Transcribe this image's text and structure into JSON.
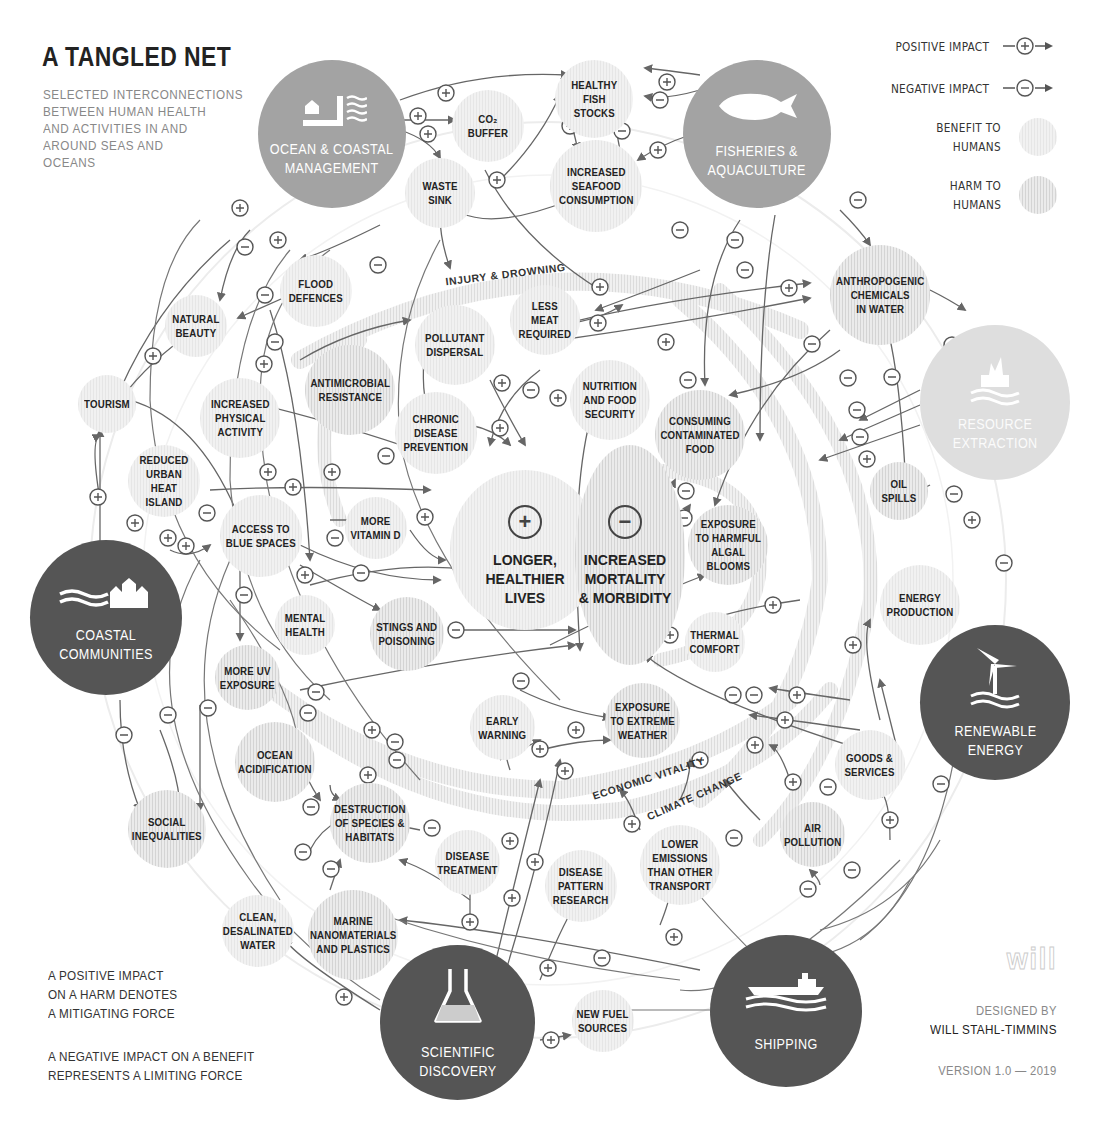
{
  "header": {
    "title": "A TANGLED NET",
    "subtitle": "SELECTED INTERCONNECTIONS\nBETWEEN HUMAN HEALTH\nAND ACTIVITIES IN AND\nAROUND SEAS AND\nOCEANS"
  },
  "legend": {
    "positive_impact": "POSITIVE IMPACT",
    "negative_impact": "NEGATIVE IMPACT",
    "benefit": "BENEFIT TO\nHUMANS",
    "harm": "HARM TO\nHUMANS",
    "positive_icon": "plus-arrow-icon",
    "negative_icon": "minus-arrow-icon"
  },
  "notes": {
    "mitigating": "A POSITIVE IMPACT\nON A HARM DENOTES\nA MITIGATING FORCE",
    "limiting": "A NEGATIVE IMPACT ON A BENEFIT\nREPRESENTS A LIMITING FORCE"
  },
  "credit": {
    "logo": "will",
    "designed_by_label": "DESIGNED BY",
    "designer": "WILL STAHL-TIMMINS",
    "version": "VERSION 1.0 — 2019"
  },
  "colors": {
    "hub_dark": "#555555",
    "hub_mid": "#a3a3a3",
    "hub_light": "#dedede",
    "line": "#666666",
    "benefit_fill": "#efefef",
    "harm_fill": "#e0e0e0"
  },
  "center": {
    "benefit": {
      "sign": "+",
      "label": "LONGER,\nHEALTHIER\nLIVES"
    },
    "harm": {
      "sign": "−",
      "label": "INCREASED\nMORTALITY\n& MORBIDITY"
    }
  },
  "bands": {
    "injury": "INJURY & DROWNING",
    "economic": "ECONOMIC VITALITY",
    "climate": "CLIMATE CHANGE"
  },
  "hubs": [
    {
      "id": "ocean",
      "label": "OCEAN & COASTAL\nMANAGEMENT",
      "icon": "coastal-management-icon"
    },
    {
      "id": "fisheries",
      "label": "FISHERIES &\nAQUACULTURE",
      "icon": "fish-icon"
    },
    {
      "id": "resource",
      "label": "RESOURCE\nEXTRACTION",
      "icon": "oil-rig-icon"
    },
    {
      "id": "renewable",
      "label": "RENEWABLE\nENERGY",
      "icon": "wind-turbine-icon"
    },
    {
      "id": "shipping",
      "label": "SHIPPING",
      "icon": "ship-icon"
    },
    {
      "id": "science",
      "label": "SCIENTIFIC\nDISCOVERY",
      "icon": "flask-icon"
    },
    {
      "id": "coastal",
      "label": "COASTAL\nCOMMUNITIES",
      "icon": "coastal-town-icon"
    }
  ],
  "nodes": [
    {
      "label": "HEALTHY\nFISH\nSTOCKS",
      "type": "benefit"
    },
    {
      "label": "CO₂\nBUFFER",
      "type": "benefit"
    },
    {
      "label": "WASTE\nSINK",
      "type": "benefit"
    },
    {
      "label": "INCREASED\nSEAFOOD\nCONSUMPTION",
      "type": "benefit"
    },
    {
      "label": "FLOOD\nDEFENCES",
      "type": "benefit"
    },
    {
      "label": "NATURAL\nBEAUTY",
      "type": "benefit"
    },
    {
      "label": "LESS\nMEAT\nREQUIRED",
      "type": "benefit"
    },
    {
      "label": "ANTHROPOGENIC\nCHEMICALS\nIN WATER",
      "type": "harm"
    },
    {
      "label": "POLLUTANT\nDISPERSAL",
      "type": "benefit"
    },
    {
      "label": "ANTIMICROBIAL\nRESISTANCE",
      "type": "harm"
    },
    {
      "label": "NUTRITION\nAND FOOD\nSECURITY",
      "type": "benefit"
    },
    {
      "label": "TOURISM",
      "type": "benefit"
    },
    {
      "label": "INCREASED\nPHYSICAL\nACTIVITY",
      "type": "benefit"
    },
    {
      "label": "CHRONIC\nDISEASE\nPREVENTION",
      "type": "benefit"
    },
    {
      "label": "CONSUMING\nCONTAMINATED\nFOOD",
      "type": "harm"
    },
    {
      "label": "REDUCED\nURBAN HEAT\nISLAND",
      "type": "benefit"
    },
    {
      "label": "OIL\nSPILLS",
      "type": "harm"
    },
    {
      "label": "ACCESS TO\nBLUE SPACES",
      "type": "benefit"
    },
    {
      "label": "MORE\nVITAMIN D",
      "type": "benefit"
    },
    {
      "label": "EXPOSURE\nTO HARMFUL\nALGAL\nBLOOMS",
      "type": "harm"
    },
    {
      "label": "ENERGY\nPRODUCTION",
      "type": "benefit"
    },
    {
      "label": "MENTAL\nHEALTH",
      "type": "benefit"
    },
    {
      "label": "STINGS AND\nPOISONING",
      "type": "harm"
    },
    {
      "label": "THERMAL\nCOMFORT",
      "type": "benefit"
    },
    {
      "label": "MORE UV\nEXPOSURE",
      "type": "harm"
    },
    {
      "label": "EXPOSURE\nTO EXTREME\nWEATHER",
      "type": "harm"
    },
    {
      "label": "EARLY\nWARNING",
      "type": "benefit"
    },
    {
      "label": "OCEAN\nACIDIFICATION",
      "type": "harm"
    },
    {
      "label": "GOODS &\nSERVICES",
      "type": "benefit"
    },
    {
      "label": "SOCIAL\nINEQUALITIES",
      "type": "harm"
    },
    {
      "label": "DESTRUCTION\nOF SPECIES &\nHABITATS",
      "type": "harm"
    },
    {
      "label": "DISEASE\nTREATMENT",
      "type": "benefit"
    },
    {
      "label": "AIR\nPOLLUTION",
      "type": "harm"
    },
    {
      "label": "DISEASE\nPATTERN\nRESEARCH",
      "type": "benefit"
    },
    {
      "label": "LOWER\nEMISSIONS\nTHAN OTHER\nTRANSPORT",
      "type": "benefit"
    },
    {
      "label": "CLEAN,\nDESALINATED\nWATER",
      "type": "benefit"
    },
    {
      "label": "MARINE\nNANOMATERIALS\nAND PLASTICS",
      "type": "harm"
    },
    {
      "label": "NEW FUEL\nSOURCES",
      "type": "benefit"
    }
  ]
}
